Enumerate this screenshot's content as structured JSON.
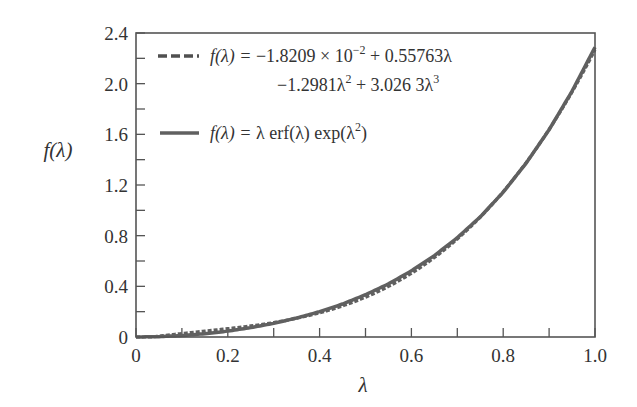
{
  "chart_data": {
    "type": "line",
    "title": "",
    "xlabel": "λ",
    "ylabel": "f(λ)",
    "xlim": [
      0,
      1.0
    ],
    "ylim": [
      0,
      2.4
    ],
    "grid": false,
    "legend_position": "upper left",
    "x_ticks": [
      "0",
      "0.2",
      "0.4",
      "0.6",
      "0.8",
      "1.0"
    ],
    "x_minor_step": 0.1,
    "y_ticks": [
      "0",
      "0.4",
      "0.8",
      "1.2",
      "1.6",
      "2.0",
      "2.4"
    ],
    "y_minor_step": 0.2,
    "x": [
      0,
      0.05,
      0.1,
      0.15,
      0.2,
      0.25,
      0.3,
      0.35,
      0.4,
      0.45,
      0.5,
      0.55,
      0.6,
      0.65,
      0.7,
      0.75,
      0.8,
      0.85,
      0.9,
      0.95,
      1.0
    ],
    "series": [
      {
        "name": "f(λ) = −1.8209 × 10⁻² + 0.55763λ − 1.2981λ² + 3.0263λ³",
        "style": "dashed",
        "coefficients": [
          -0.018209,
          0.55763,
          -1.2981,
          3.0263
        ],
        "values": [
          -0.0182,
          0.0074,
          0.0284,
          0.0472,
          0.0662,
          0.0876,
          0.1141,
          0.1478,
          0.1913,
          0.2469,
          0.317,
          0.4039,
          0.5101,
          0.6379,
          0.7897,
          0.9678,
          1.1748,
          1.4128,
          1.6843,
          1.9917,
          2.3373
        ]
      },
      {
        "name": "f(λ) = λ erf(λ) exp(λ²)",
        "style": "solid",
        "values": [
          0,
          0.0028,
          0.0113,
          0.0257,
          0.0464,
          0.0739,
          0.1077,
          0.15,
          0.2,
          0.2605,
          0.3339,
          0.4193,
          0.5222,
          0.6426,
          0.7836,
          0.9482,
          1.1431,
          1.3726,
          1.6363,
          1.9408,
          2.2875
        ]
      }
    ]
  },
  "legend": {
    "entry1_lhs": "f(λ) = ",
    "entry1_line1": "−1.8209 × 10",
    "entry1_exp": "−2",
    "entry1_line1b": " + 0.55763λ",
    "entry1_line2a": "−1.2981λ",
    "entry1_sup2": "2",
    "entry1_line2b": " + 3.026 3λ",
    "entry1_sup3": "3",
    "entry2_lhs": "f(λ) = ",
    "entry2_rhs_a": "λ erf(λ) exp(λ",
    "entry2_sup": "2",
    "entry2_rhs_b": ")"
  },
  "colors": {
    "axis": "#555555",
    "curve": "#606060",
    "text": "#333333"
  }
}
